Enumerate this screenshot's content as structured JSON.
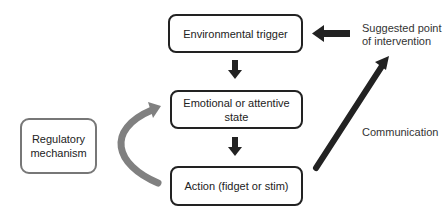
{
  "diagram": {
    "nodes": {
      "environmental_trigger": "Environmental trigger",
      "emotional_state": "Emotional or attentive state",
      "action": "Action (fidget or stim)",
      "regulatory_mechanism_line1": "Regulatory",
      "regulatory_mechanism_line2": "mechanism"
    },
    "labels": {
      "intervention_line1": "Suggested point",
      "intervention_line2": "of intervention",
      "communication": "Communication"
    },
    "edges": [
      {
        "from": "Environmental trigger",
        "to": "Emotional or attentive state",
        "style": "black"
      },
      {
        "from": "Emotional or attentive state",
        "to": "Action (fidget or stim)",
        "style": "black"
      },
      {
        "from": "Action (fidget or stim)",
        "to": "Emotional or attentive state",
        "via": "Regulatory mechanism",
        "style": "gray-curved"
      },
      {
        "from": "Action (fidget or stim)",
        "to": "Suggested point of intervention",
        "label": "Communication",
        "style": "black-diagonal"
      },
      {
        "from": "Suggested point of intervention",
        "to": "Environmental trigger",
        "style": "black"
      }
    ],
    "colors": {
      "primary": "#222222",
      "secondary": "#808080"
    }
  }
}
